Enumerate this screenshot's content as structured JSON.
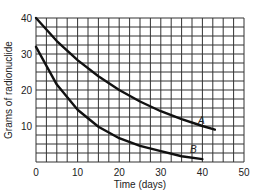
{
  "chart_data": {
    "type": "line",
    "title": "",
    "xlabel": "Time (days)",
    "ylabel": "Grams of radionuclide",
    "xlim": [
      0,
      50
    ],
    "ylim": [
      0,
      40
    ],
    "x_ticks": [
      "0",
      "10",
      "20",
      "30",
      "40",
      "50"
    ],
    "y_ticks": [
      "10",
      "20",
      "30",
      "40"
    ],
    "grid": true,
    "grid_x_step": 2.5,
    "grid_y_step": 2.5,
    "series": [
      {
        "name": "A",
        "x": [
          0,
          5,
          10,
          15,
          20,
          25,
          30,
          35,
          40,
          43
        ],
        "values": [
          40,
          33.6,
          28.3,
          23.8,
          20,
          16.8,
          14.1,
          11.9,
          10,
          9
        ]
      },
      {
        "name": "B",
        "x": [
          0,
          5,
          10,
          15,
          20,
          25,
          30,
          35,
          40
        ],
        "values": [
          32,
          21.5,
          14.5,
          9.8,
          6.6,
          4.5,
          3,
          1.6,
          0.8
        ]
      }
    ],
    "annotations": [
      "A",
      "B"
    ]
  }
}
